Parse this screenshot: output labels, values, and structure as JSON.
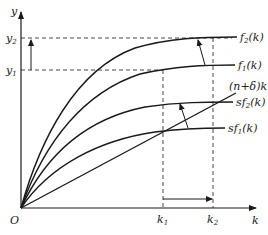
{
  "diagram": {
    "type": "solow-growth-model",
    "axes": {
      "y_label": "y",
      "x_label": "k",
      "origin_label": "O"
    },
    "y_ticks": [
      {
        "base": "y",
        "sub": "2",
        "label": "y2"
      },
      {
        "base": "y",
        "sub": "1",
        "label": "y1"
      }
    ],
    "x_ticks": [
      {
        "base": "k",
        "sub": "1",
        "label": "k1"
      },
      {
        "base": "k",
        "sub": "2",
        "label": "k2"
      }
    ],
    "curves": [
      {
        "id": "f2",
        "pre": "f",
        "sub": "2",
        "post": "(k)",
        "label": "f2(k)"
      },
      {
        "id": "f1",
        "pre": "f",
        "sub": "1",
        "post": "(k)",
        "label": "f1(k)"
      },
      {
        "id": "break_even",
        "pre": "(n+δ)k",
        "sub": "",
        "post": "",
        "label": "(n+δ)k"
      },
      {
        "id": "sf2",
        "pre": "sf",
        "sub": "2",
        "post": "(k)",
        "label": "sf2(k)"
      },
      {
        "id": "sf1",
        "pre": "sf",
        "sub": "1",
        "post": "(k)",
        "label": "sf1(k)"
      }
    ],
    "colors": {
      "line": "#1a1a1a",
      "dashed": "#333333",
      "background": "#ffffff"
    }
  }
}
